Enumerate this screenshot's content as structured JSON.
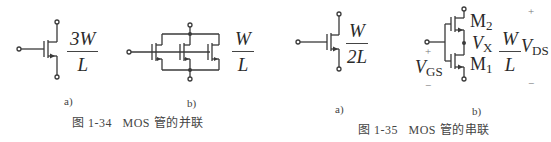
{
  "figures": [
    {
      "id": "1-34",
      "caption": "图 1-34   MOS 管的并联",
      "panels": [
        {
          "label": "a)",
          "ratio": {
            "numerator": "3W",
            "denominator": "L"
          },
          "description": "single MOS transistor equivalent"
        },
        {
          "label": "b)",
          "ratio": {
            "numerator": "W",
            "denominator": "L"
          },
          "description": "three MOS transistors in parallel"
        }
      ]
    },
    {
      "id": "1-35",
      "caption": "图 1-35   MOS 管的串联",
      "panels": [
        {
          "label": "a)",
          "ratio": {
            "numerator": "W",
            "denominator": "2L"
          },
          "description": "single MOS transistor equivalent"
        },
        {
          "label": "b)",
          "ratio": {
            "numerator": "W",
            "denominator": "L"
          },
          "description": "two MOS transistors in series",
          "devices": {
            "top": "M",
            "top_sub": "2",
            "bottom": "M",
            "bottom_sub": "1"
          },
          "node": {
            "name": "V",
            "sub": "X"
          },
          "vgs": {
            "name": "V",
            "sub": "GS",
            "plus": "+",
            "minus": "−"
          },
          "vds": {
            "name": "V",
            "sub": "DS",
            "plus": "+",
            "minus": "−"
          }
        }
      ]
    }
  ]
}
